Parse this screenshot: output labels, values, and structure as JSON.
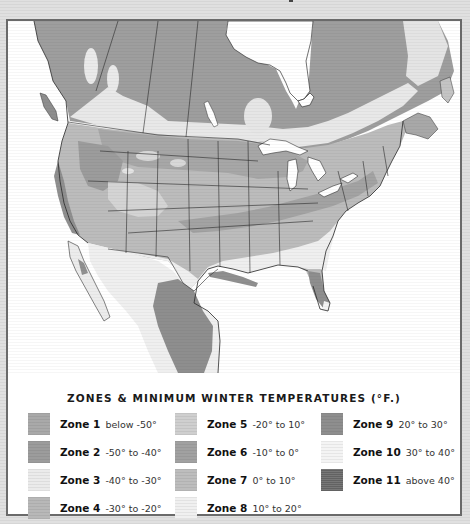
{
  "map": {
    "subject": "North America plant hardiness zones",
    "regions": [
      "Canada",
      "United States",
      "Mexico"
    ],
    "water_features": [
      "Hudson Bay",
      "Great Lakes",
      "Gulf of Mexico",
      "Pacific Ocean",
      "Atlantic Ocean"
    ]
  },
  "legend": {
    "title": "ZONES & MINIMUM WINTER TEMPERATURES (°F.)",
    "zones": [
      {
        "label": "Zone 1",
        "range": "below -50°",
        "color": "#a9a9a9"
      },
      {
        "label": "Zone 2",
        "range": "-50° to -40°",
        "color": "#9c9c9c"
      },
      {
        "label": "Zone 3",
        "range": "-40° to -30°",
        "color": "#ebebeb"
      },
      {
        "label": "Zone 4",
        "range": "-30° to -20°",
        "color": "#b8b8b8"
      },
      {
        "label": "Zone 5",
        "range": "-20° to 10°",
        "color": "#cfcfcf"
      },
      {
        "label": "Zone 6",
        "range": "-10° to 0°",
        "color": "#a1a1a1"
      },
      {
        "label": "Zone 7",
        "range": "0° to 10°",
        "color": "#bdbdbd"
      },
      {
        "label": "Zone 8",
        "range": "10° to 20°",
        "color": "#f0f0f0"
      },
      {
        "label": "Zone 9",
        "range": "20° to 30°",
        "color": "#8e8e8e"
      },
      {
        "label": "Zone 10",
        "range": "30° to 40°",
        "color": "#f4f4f4"
      },
      {
        "label": "Zone 11",
        "range": "above 40°",
        "color": "#777777"
      }
    ]
  },
  "colors": {
    "water": "#ffffff",
    "border_lines": "#2a2a2a",
    "frame": "#6a6a6a",
    "background": "#dcdcdc"
  }
}
